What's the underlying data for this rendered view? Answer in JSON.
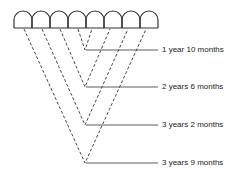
{
  "diagram": {
    "arch_count": 8,
    "ink_color": "#333333",
    "labels": [
      {
        "text": "1 year 10 months",
        "y": 50
      },
      {
        "text": "2 years 6 months",
        "y": 87
      },
      {
        "text": "3 years 2 months",
        "y": 125
      },
      {
        "text": "3 years 9 months",
        "y": 163
      }
    ]
  }
}
